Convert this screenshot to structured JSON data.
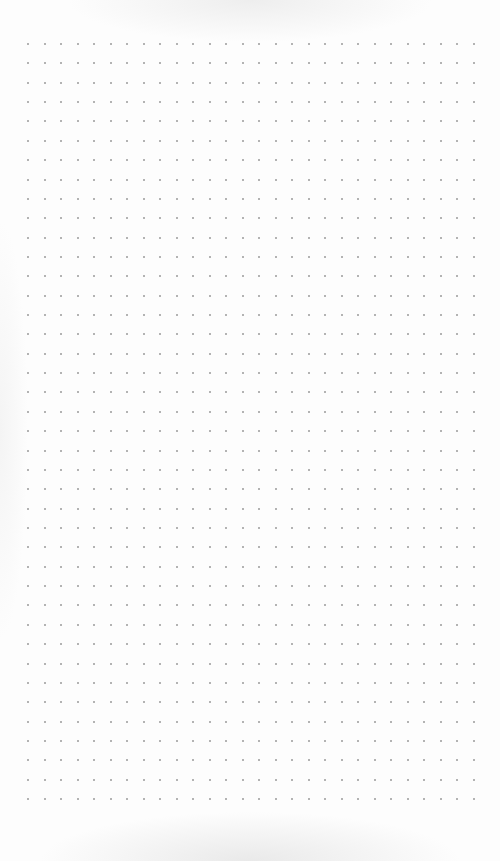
{
  "page": {
    "type": "dot-grid paper",
    "background_color": "#fdfdfd",
    "dot_color": "#9a9a9a"
  },
  "grid": {
    "columns": 28,
    "rows": 40,
    "origin_x": 28,
    "origin_y": 44,
    "spacing_x": 16.52,
    "spacing_y": 19.36
  }
}
